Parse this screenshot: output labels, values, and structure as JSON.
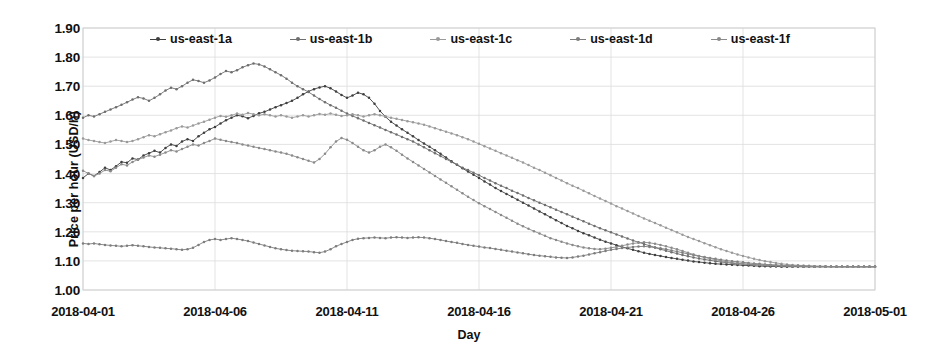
{
  "chart_data": {
    "type": "line",
    "title": "",
    "xlabel": "Day",
    "ylabel": "Price per hour (USD/h)",
    "ylim": [
      1.0,
      1.9
    ],
    "ytick_labels": [
      "1.90",
      "1.80",
      "1.70",
      "1.60",
      "1.50",
      "1.40",
      "1.30",
      "1.20",
      "1.10",
      "1.00"
    ],
    "ytick_values": [
      1.9,
      1.8,
      1.7,
      1.6,
      1.5,
      1.4,
      1.3,
      1.2,
      1.1,
      1.0
    ],
    "xtick_labels": [
      "2018-04-01",
      "2018-04-06",
      "2018-04-11",
      "2018-04-16",
      "2018-04-21",
      "2018-04-26",
      "2018-05-01"
    ],
    "xtick_values": [
      0,
      5,
      10,
      15,
      20,
      25,
      30
    ],
    "xlim": [
      0,
      30
    ],
    "grid": "horizontal-and-vertical-light",
    "legend_position": "top-inside",
    "markers": "small-filled-circle",
    "colors": {
      "us-east-1a": "#3f3f3f",
      "us-east-1b": "#6e6e6e",
      "us-east-1c": "#9a9a9a",
      "us-east-1d": "#7d7d7d",
      "us-east-1f": "#8a8a8a"
    },
    "series": [
      {
        "name": "us-east-1a",
        "values": [
          1.385,
          1.4,
          1.392,
          1.405,
          1.42,
          1.412,
          1.425,
          1.44,
          1.437,
          1.452,
          1.448,
          1.462,
          1.47,
          1.478,
          1.472,
          1.488,
          1.5,
          1.495,
          1.51,
          1.518,
          1.512,
          1.528,
          1.54,
          1.552,
          1.56,
          1.572,
          1.583,
          1.592,
          1.6,
          1.597,
          1.59,
          1.598,
          1.607,
          1.612,
          1.62,
          1.628,
          1.635,
          1.642,
          1.65,
          1.66,
          1.672,
          1.682,
          1.69,
          1.696,
          1.7,
          1.693,
          1.682,
          1.67,
          1.66,
          1.668,
          1.678,
          1.672,
          1.66,
          1.64,
          1.615,
          1.595,
          1.578,
          1.565,
          1.552,
          1.54,
          1.528,
          1.515,
          1.503,
          1.492,
          1.48,
          1.468,
          1.455,
          1.442,
          1.43,
          1.418,
          1.407,
          1.396,
          1.385,
          1.373,
          1.362,
          1.35,
          1.34,
          1.33,
          1.32,
          1.31,
          1.3,
          1.29,
          1.28,
          1.27,
          1.26,
          1.25,
          1.24,
          1.23,
          1.22,
          1.212,
          1.203,
          1.195,
          1.188,
          1.18,
          1.173,
          1.166,
          1.16,
          1.154,
          1.148,
          1.143,
          1.138,
          1.133,
          1.128,
          1.124,
          1.12,
          1.117,
          1.113,
          1.11,
          1.107,
          1.104,
          1.101,
          1.098,
          1.096,
          1.094,
          1.092,
          1.09,
          1.089,
          1.088,
          1.087,
          1.086,
          1.085,
          1.084,
          1.083,
          1.082,
          1.082,
          1.081,
          1.081,
          1.08,
          1.08,
          1.08,
          1.08,
          1.08,
          1.08,
          1.08,
          1.08,
          1.08,
          1.08,
          1.08,
          1.08,
          1.08,
          1.08,
          1.08,
          1.08,
          1.08,
          1.08
        ]
      },
      {
        "name": "us-east-1b",
        "values": [
          1.592,
          1.6,
          1.596,
          1.604,
          1.612,
          1.62,
          1.628,
          1.636,
          1.645,
          1.654,
          1.662,
          1.658,
          1.65,
          1.66,
          1.672,
          1.685,
          1.695,
          1.69,
          1.7,
          1.712,
          1.722,
          1.718,
          1.712,
          1.72,
          1.73,
          1.742,
          1.752,
          1.748,
          1.755,
          1.765,
          1.772,
          1.778,
          1.775,
          1.768,
          1.758,
          1.748,
          1.738,
          1.726,
          1.712,
          1.7,
          1.69,
          1.68,
          1.668,
          1.656,
          1.645,
          1.635,
          1.626,
          1.616,
          1.606,
          1.598,
          1.59,
          1.582,
          1.574,
          1.566,
          1.558,
          1.55,
          1.542,
          1.534,
          1.526,
          1.518,
          1.51,
          1.5,
          1.49,
          1.48,
          1.47,
          1.46,
          1.45,
          1.44,
          1.43,
          1.42,
          1.412,
          1.403,
          1.394,
          1.385,
          1.376,
          1.367,
          1.358,
          1.35,
          1.341,
          1.333,
          1.325,
          1.316,
          1.308,
          1.3,
          1.292,
          1.284,
          1.276,
          1.268,
          1.26,
          1.252,
          1.244,
          1.236,
          1.228,
          1.22,
          1.212,
          1.205,
          1.198,
          1.191,
          1.184,
          1.177,
          1.17,
          1.164,
          1.158,
          1.152,
          1.146,
          1.14,
          1.135,
          1.13,
          1.125,
          1.12,
          1.116,
          1.112,
          1.108,
          1.105,
          1.102,
          1.099,
          1.096,
          1.094,
          1.092,
          1.09,
          1.089,
          1.088,
          1.087,
          1.086,
          1.085,
          1.084,
          1.083,
          1.082,
          1.082,
          1.081,
          1.081,
          1.08,
          1.08,
          1.08,
          1.08,
          1.08,
          1.08,
          1.08,
          1.08,
          1.08,
          1.08,
          1.08,
          1.08,
          1.08,
          1.08
        ]
      },
      {
        "name": "us-east-1c",
        "values": [
          1.52,
          1.515,
          1.512,
          1.508,
          1.505,
          1.51,
          1.515,
          1.512,
          1.508,
          1.512,
          1.518,
          1.525,
          1.532,
          1.528,
          1.535,
          1.542,
          1.548,
          1.556,
          1.562,
          1.558,
          1.565,
          1.572,
          1.578,
          1.585,
          1.592,
          1.598,
          1.595,
          1.6,
          1.606,
          1.602,
          1.608,
          1.604,
          1.6,
          1.604,
          1.6,
          1.596,
          1.6,
          1.596,
          1.592,
          1.596,
          1.6,
          1.596,
          1.6,
          1.605,
          1.602,
          1.606,
          1.602,
          1.598,
          1.6,
          1.604,
          1.6,
          1.596,
          1.6,
          1.604,
          1.6,
          1.596,
          1.592,
          1.588,
          1.584,
          1.58,
          1.576,
          1.572,
          1.568,
          1.562,
          1.556,
          1.55,
          1.544,
          1.538,
          1.532,
          1.525,
          1.518,
          1.51,
          1.502,
          1.494,
          1.486,
          1.478,
          1.47,
          1.462,
          1.454,
          1.446,
          1.438,
          1.429,
          1.42,
          1.412,
          1.403,
          1.394,
          1.385,
          1.376,
          1.367,
          1.358,
          1.35,
          1.341,
          1.332,
          1.323,
          1.314,
          1.306,
          1.297,
          1.288,
          1.28,
          1.271,
          1.263,
          1.254,
          1.246,
          1.238,
          1.23,
          1.222,
          1.214,
          1.206,
          1.198,
          1.19,
          1.182,
          1.175,
          1.168,
          1.161,
          1.154,
          1.147,
          1.14,
          1.134,
          1.128,
          1.122,
          1.117,
          1.112,
          1.107,
          1.103,
          1.099,
          1.096,
          1.093,
          1.09,
          1.088,
          1.086,
          1.085,
          1.084,
          1.083,
          1.082,
          1.082,
          1.081,
          1.081,
          1.08,
          1.08,
          1.08,
          1.08,
          1.08,
          1.08,
          1.08,
          1.08
        ]
      },
      {
        "name": "us-east-1d",
        "values": [
          1.16,
          1.158,
          1.16,
          1.157,
          1.155,
          1.153,
          1.152,
          1.15,
          1.152,
          1.154,
          1.152,
          1.15,
          1.148,
          1.146,
          1.145,
          1.143,
          1.142,
          1.14,
          1.138,
          1.14,
          1.145,
          1.155,
          1.165,
          1.172,
          1.175,
          1.172,
          1.175,
          1.178,
          1.175,
          1.172,
          1.168,
          1.163,
          1.158,
          1.153,
          1.148,
          1.143,
          1.14,
          1.137,
          1.135,
          1.134,
          1.133,
          1.132,
          1.13,
          1.128,
          1.132,
          1.14,
          1.15,
          1.158,
          1.165,
          1.172,
          1.176,
          1.178,
          1.179,
          1.18,
          1.179,
          1.178,
          1.18,
          1.181,
          1.18,
          1.179,
          1.18,
          1.181,
          1.18,
          1.178,
          1.175,
          1.172,
          1.168,
          1.165,
          1.162,
          1.158,
          1.155,
          1.152,
          1.149,
          1.146,
          1.144,
          1.141,
          1.138,
          1.135,
          1.132,
          1.129,
          1.126,
          1.123,
          1.12,
          1.118,
          1.116,
          1.114,
          1.112,
          1.111,
          1.11,
          1.112,
          1.115,
          1.118,
          1.122,
          1.126,
          1.13,
          1.134,
          1.138,
          1.141,
          1.144,
          1.146,
          1.148,
          1.149,
          1.15,
          1.148,
          1.146,
          1.143,
          1.14,
          1.136,
          1.132,
          1.128,
          1.124,
          1.12,
          1.116,
          1.113,
          1.11,
          1.107,
          1.104,
          1.101,
          1.099,
          1.097,
          1.095,
          1.093,
          1.091,
          1.09,
          1.088,
          1.087,
          1.086,
          1.085,
          1.084,
          1.083,
          1.083,
          1.082,
          1.082,
          1.081,
          1.081,
          1.081,
          1.08,
          1.08,
          1.08,
          1.08,
          1.08,
          1.08,
          1.08,
          1.08,
          1.08
        ]
      },
      {
        "name": "us-east-1f",
        "values": [
          1.41,
          1.4,
          1.392,
          1.4,
          1.412,
          1.408,
          1.42,
          1.432,
          1.428,
          1.44,
          1.448,
          1.455,
          1.462,
          1.458,
          1.465,
          1.472,
          1.48,
          1.476,
          1.484,
          1.492,
          1.5,
          1.496,
          1.505,
          1.512,
          1.52,
          1.516,
          1.512,
          1.508,
          1.505,
          1.5,
          1.496,
          1.492,
          1.488,
          1.484,
          1.48,
          1.476,
          1.472,
          1.468,
          1.462,
          1.456,
          1.45,
          1.444,
          1.438,
          1.45,
          1.468,
          1.49,
          1.51,
          1.522,
          1.516,
          1.505,
          1.492,
          1.48,
          1.472,
          1.48,
          1.492,
          1.5,
          1.49,
          1.478,
          1.465,
          1.452,
          1.44,
          1.428,
          1.416,
          1.404,
          1.392,
          1.38,
          1.368,
          1.356,
          1.344,
          1.332,
          1.32,
          1.309,
          1.298,
          1.288,
          1.278,
          1.268,
          1.258,
          1.248,
          1.238,
          1.228,
          1.219,
          1.21,
          1.202,
          1.194,
          1.186,
          1.178,
          1.172,
          1.166,
          1.16,
          1.155,
          1.15,
          1.146,
          1.143,
          1.141,
          1.14,
          1.142,
          1.145,
          1.148,
          1.152,
          1.156,
          1.16,
          1.162,
          1.164,
          1.162,
          1.159,
          1.155,
          1.15,
          1.145,
          1.14,
          1.134,
          1.128,
          1.122,
          1.117,
          1.112,
          1.108,
          1.104,
          1.1,
          1.097,
          1.094,
          1.092,
          1.09,
          1.089,
          1.088,
          1.087,
          1.086,
          1.085,
          1.084,
          1.083,
          1.083,
          1.082,
          1.082,
          1.081,
          1.081,
          1.081,
          1.08,
          1.08,
          1.08,
          1.08,
          1.08,
          1.08,
          1.08,
          1.08,
          1.08,
          1.08,
          1.08
        ]
      }
    ],
    "legend_entries": [
      "us-east-1a",
      "us-east-1b",
      "us-east-1c",
      "us-east-1d",
      "us-east-1f"
    ]
  }
}
